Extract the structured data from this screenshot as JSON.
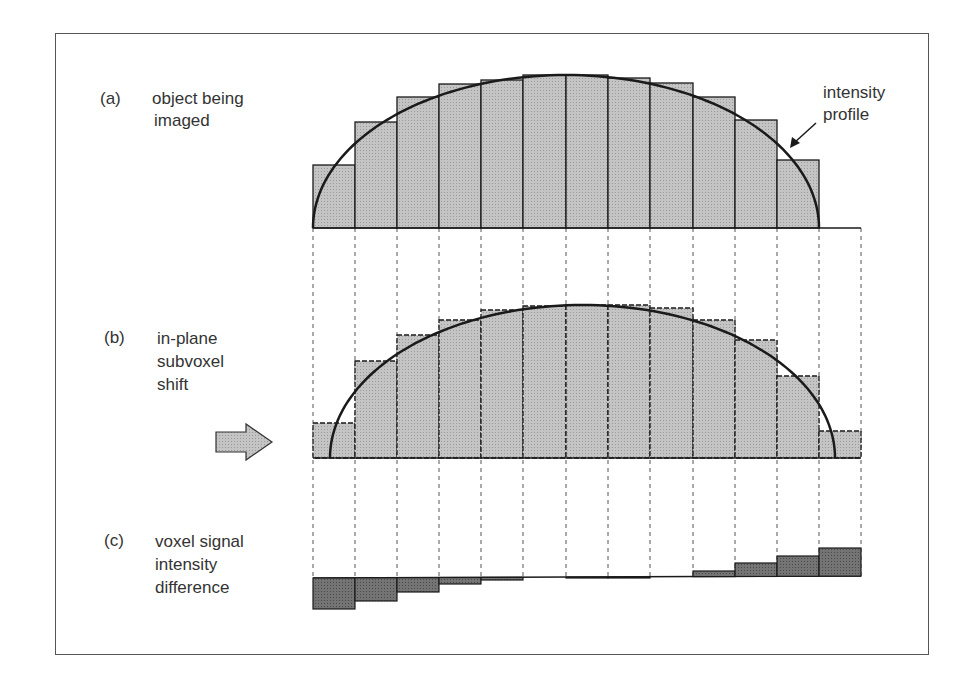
{
  "panels": [
    {
      "id": "a",
      "tag": "(a)",
      "lines": [
        "object being",
        "imaged"
      ]
    },
    {
      "id": "b",
      "tag": "(b)",
      "lines": [
        "in-plane",
        "subvoxel",
        "shift"
      ]
    },
    {
      "id": "c",
      "tag": "(c)",
      "lines": [
        "voxel signal",
        "intensity",
        "difference"
      ]
    }
  ],
  "annotation": {
    "lines": [
      "intensity",
      "profile"
    ]
  },
  "colors": {
    "bar_fill": "#bdbdbd",
    "diff_fill": "#6e6e6e",
    "stroke": "#1a1a1a",
    "frame": "#555555"
  },
  "grid": {
    "bin_edges_x": [
      313,
      355,
      397,
      439,
      481,
      523,
      566,
      608,
      650,
      693,
      735,
      777,
      819,
      861
    ]
  },
  "panel_a": {
    "baseline_y": 228,
    "bar_tops_y": [
      165,
      122,
      97,
      84,
      80,
      75,
      75,
      78,
      83,
      97,
      120,
      160
    ]
  },
  "panel_b": {
    "baseline_y": 458,
    "bar_tops_y": [
      423,
      361,
      335,
      320,
      310,
      306,
      305,
      305,
      308,
      320,
      340,
      376,
      431
    ]
  },
  "panel_c": {
    "baseline_y": 578,
    "bar_ends_y": [
      609,
      601,
      592,
      584,
      580,
      578,
      578,
      578,
      577,
      571,
      563,
      556,
      548
    ]
  }
}
